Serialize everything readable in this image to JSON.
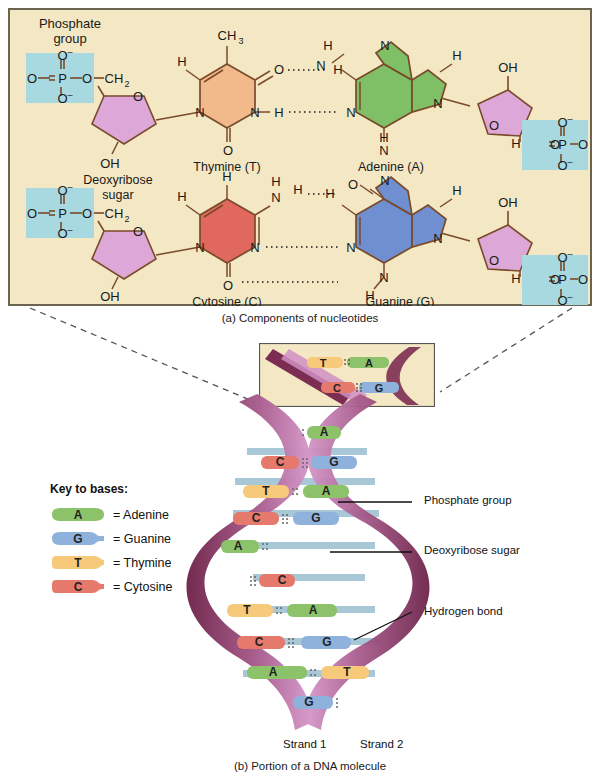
{
  "figure": {
    "panel_a_caption": "(a) Components of nucleotides",
    "panel_b_caption": "(b) Portion of a DNA molecule"
  },
  "colors": {
    "panel_bg": "#f3e7c4",
    "panel_border": "#6b6550",
    "phosphate_box": "#a8d8e0",
    "sugar": "#dda7d8",
    "thymine": "#f2b98a",
    "adenine": "#7fbf65",
    "cytosine": "#e0685e",
    "guanine": "#6f8fd0",
    "bond_stroke": "#7a4a2a",
    "legend_adenine": "#8cc26a",
    "legend_guanine": "#8fb2dd",
    "legend_thymine": "#f7c97a",
    "legend_cytosine": "#e5796c",
    "ribbon_dark": "#7c2d52",
    "ribbon_light": "#cf8fc4",
    "rung_blue": "#a8c8d8",
    "text": "#1a1a1a"
  },
  "panel_a": {
    "labels": {
      "phosphate_group": "Phosphate",
      "phosphate_group_2": "group",
      "deoxyribose": "Deoxyribose",
      "deoxyribose_2": "sugar",
      "thymine": "Thymine (T)",
      "adenine": "Adenine (A)",
      "cytosine": "Cytosine (C)",
      "guanine": "Guanine (G)"
    },
    "atoms": {
      "O": "O",
      "O_minus": "O",
      "P": "P",
      "CH2": "CH",
      "CH2_sub": "2",
      "H2C": "H",
      "H2C_sub": "2",
      "H2C_c": "C",
      "N": "N",
      "H": "H",
      "C": "C",
      "OH": "OH",
      "CH3": "CH",
      "CH3_sub": "3",
      "minus": "–"
    },
    "pairs": [
      {
        "left": "Thymine (T)",
        "right": "Adenine (A)",
        "hbonds": 2
      },
      {
        "left": "Cytosine (C)",
        "right": "Guanine (G)",
        "hbonds": 3
      }
    ]
  },
  "legend": {
    "title": "Key to bases:",
    "items": [
      {
        "letter": "A",
        "label": "= Adenine",
        "shape": "adenine"
      },
      {
        "letter": "G",
        "label": "= Guanine",
        "shape": "guanine"
      },
      {
        "letter": "T",
        "label": "= Thymine",
        "shape": "thymine"
      },
      {
        "letter": "C",
        "label": "= Cytosine",
        "shape": "cytosine"
      }
    ]
  },
  "callouts": [
    {
      "text": "Phosphate group"
    },
    {
      "text": "Deoxyribose sugar"
    },
    {
      "text": "Hydrogen bond"
    }
  ],
  "helix": {
    "strand_labels": [
      "Strand 1",
      "Strand 2"
    ],
    "inset_pairs": [
      {
        "left": "T",
        "right": "A"
      },
      {
        "left": "C",
        "right": "G"
      }
    ],
    "base_pairs": [
      {
        "left": "",
        "right": "A",
        "y": 432
      },
      {
        "left": "C",
        "right": "G",
        "y": 463
      },
      {
        "left": "T",
        "right": "A",
        "y": 492
      },
      {
        "left": "C",
        "right": "G",
        "y": 518
      },
      {
        "left": "A",
        "right": "",
        "y": 545
      },
      {
        "left": "",
        "right": "C",
        "y": 580
      },
      {
        "left": "T",
        "right": "A",
        "y": 611
      },
      {
        "left": "C",
        "right": "G",
        "y": 643
      },
      {
        "left": "A",
        "right": "T",
        "y": 673
      },
      {
        "left": "G",
        "right": "",
        "y": 700
      }
    ]
  }
}
